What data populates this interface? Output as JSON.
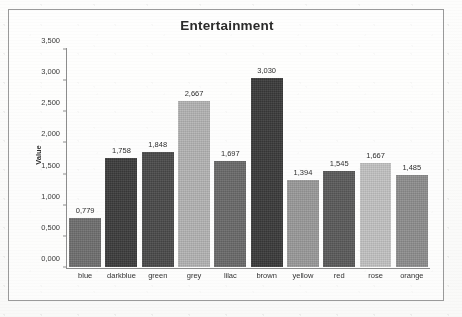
{
  "chart_data": {
    "type": "bar",
    "title": "Entertainment",
    "xlabel": "",
    "ylabel": "Value",
    "categories": [
      "blue",
      "darkblue",
      "green",
      "grey",
      "lilac",
      "brown",
      "yellow",
      "red",
      "rose",
      "orange"
    ],
    "values": [
      0.779,
      1.758,
      1.848,
      2.667,
      1.697,
      3.03,
      1.394,
      1.545,
      1.667,
      1.485
    ],
    "value_labels": [
      "0,779",
      "1,758",
      "1,848",
      "2,667",
      "1,697",
      "3,030",
      "1,394",
      "1,545",
      "1,667",
      "1,485"
    ],
    "bar_colors": [
      "#6f6f6f",
      "#3c3c3c",
      "#4a4a4a",
      "#b4b4b4",
      "#6a6a6a",
      "#3a3a3a",
      "#9a9a9a",
      "#5a5a5a",
      "#c3c3c3",
      "#8e8e8e"
    ],
    "ylim": [
      0,
      3.5
    ],
    "ytick_labels": [
      "0,000",
      "0,500",
      "1,000",
      "1,500",
      "2,000",
      "2,500",
      "3,000",
      "3,500"
    ],
    "ytick_values": [
      0,
      0.5,
      1.0,
      1.5,
      2.0,
      2.5,
      3.0,
      3.5
    ],
    "grid": false,
    "legend": "none",
    "decimal_separator": ",",
    "frame_color": "#9a9a9a",
    "axis_color": "#8d8d8d",
    "text_color": "#2f2f2f"
  }
}
